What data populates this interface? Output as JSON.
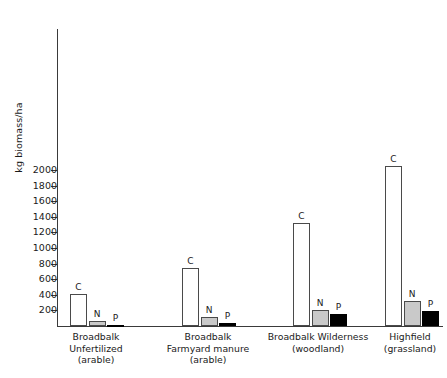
{
  "chart_data": {
    "type": "bar",
    "title": "",
    "xlabel": "",
    "ylabel": "kg biomass/ha",
    "ylim": [
      0,
      2100
    ],
    "yticks": [
      200,
      400,
      600,
      800,
      1000,
      1200,
      1400,
      1600,
      1800,
      2000
    ],
    "ytick_labels": [
      "200",
      "400",
      "600",
      "800",
      "1000",
      "1200",
      "1400",
      "1600",
      "1800",
      "2000"
    ],
    "grid": false,
    "legend": "none",
    "categories": [
      "Broadbalk Unfertilized (arable)",
      "Broadbalk Farmyard manure (arable)",
      "Broadbalk Wilderness (woodland)",
      "Highfield (grassland)"
    ],
    "series": [
      {
        "name": "C",
        "values": [
          410,
          745,
          1320,
          2045
        ],
        "color": "#ffffff"
      },
      {
        "name": "N",
        "values": [
          65,
          120,
          200,
          320
        ],
        "color": "#c9c9c9"
      },
      {
        "name": "P",
        "values": [
          14,
          42,
          150,
          190
        ],
        "color": "#000000"
      }
    ],
    "point_labels": [
      [
        "C",
        "N",
        "P"
      ],
      [
        "C",
        "N",
        "P"
      ],
      [
        "C",
        "N",
        "P"
      ],
      [
        "C",
        "N",
        "P"
      ]
    ]
  },
  "axis": {
    "y_label": "kg biomass/ha"
  },
  "groups": [
    {
      "id": "broadbalk-unfertilized",
      "lines": [
        "Broadbalk",
        "Unfertilized",
        "(arable)"
      ],
      "bars": [
        {
          "label": "C",
          "value": 410,
          "kind": "c"
        },
        {
          "label": "N",
          "value": 65,
          "kind": "n"
        },
        {
          "label": "P",
          "value": 14,
          "kind": "p"
        }
      ]
    },
    {
      "id": "broadbalk-farmyard-manure",
      "lines": [
        "Broadbalk",
        "Farmyard manure",
        "(arable)"
      ],
      "bars": [
        {
          "label": "C",
          "value": 745,
          "kind": "c"
        },
        {
          "label": "N",
          "value": 120,
          "kind": "n"
        },
        {
          "label": "P",
          "value": 42,
          "kind": "p"
        }
      ]
    },
    {
      "id": "broadbalk-wilderness",
      "lines": [
        "Broadbalk Wilderness",
        "(woodland)"
      ],
      "bars": [
        {
          "label": "C",
          "value": 1320,
          "kind": "c"
        },
        {
          "label": "N",
          "value": 200,
          "kind": "n"
        },
        {
          "label": "P",
          "value": 150,
          "kind": "p"
        }
      ]
    },
    {
      "id": "highfield",
      "lines": [
        "Highfield",
        "(grassland)"
      ],
      "bars": [
        {
          "label": "C",
          "value": 2045,
          "kind": "n-a"
        },
        {
          "label": "N",
          "value": 320,
          "kind": "n"
        },
        {
          "label": "P",
          "value": 190,
          "kind": "p"
        }
      ]
    }
  ]
}
